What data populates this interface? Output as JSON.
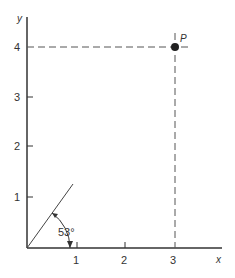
{
  "diagram": {
    "axes": {
      "x_label": "x",
      "y_label": "y",
      "x_ticks": [
        "1",
        "2",
        "3"
      ],
      "y_ticks": [
        "1",
        "2",
        "3",
        "4"
      ]
    },
    "point": {
      "label": "P",
      "x": 3,
      "y": 4
    },
    "angle": {
      "label": "53°",
      "degrees": 53
    },
    "colors": {
      "ink": "#333333",
      "background": "#ffffff"
    }
  }
}
